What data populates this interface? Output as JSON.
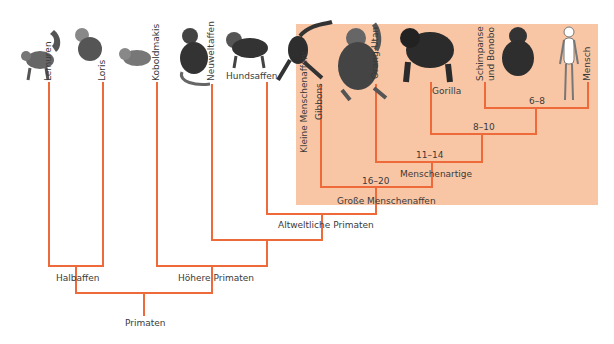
{
  "diagram": {
    "type": "cladogram",
    "colors": {
      "line": "#ef6a3a",
      "highlight": "#f9c6a5",
      "text": "#3a3a3a"
    },
    "taxa": [
      {
        "id": "lemuren",
        "label": "Lemuren",
        "icon": "lemur-icon"
      },
      {
        "id": "loris",
        "label": "Loris",
        "icon": "loris-icon"
      },
      {
        "id": "koboldmakis",
        "label": "Koboldmakis",
        "icon": "tarsier-icon"
      },
      {
        "id": "neuweltaffen",
        "label": "Neuweltaffen",
        "icon": "new-world-monkey-icon"
      },
      {
        "id": "hundsaffen",
        "label": "Hundsaffen",
        "icon": "baboon-icon"
      },
      {
        "id": "gibbons",
        "label": "Gibbons",
        "icon": "gibbon-icon"
      },
      {
        "id": "orang_utan",
        "label": "Orang-Utan",
        "icon": "orangutan-icon"
      },
      {
        "id": "gorilla",
        "label": "Gorilla",
        "icon": "gorilla-icon"
      },
      {
        "id": "schimpanse",
        "label": "Schimpanse und Bonobo",
        "label_line1": "Schimpanse",
        "label_line2": "und Bonobo",
        "icon": "chimpanzee-icon"
      },
      {
        "id": "mensch",
        "label": "Mensch",
        "icon": "human-icon"
      }
    ],
    "group_side_label": "Kleine Menschenaffen:",
    "nodes": [
      {
        "id": "n68",
        "label": "6–8"
      },
      {
        "id": "n810",
        "label": "8–10"
      },
      {
        "id": "n1114",
        "label": "11–14"
      },
      {
        "id": "menschenartige",
        "label": "Menschenartige"
      },
      {
        "id": "n1620",
        "label": "16–20"
      },
      {
        "id": "grosse",
        "label": "Große Menschenaffen"
      },
      {
        "id": "altwelt",
        "label": "Altweltliche Primaten"
      },
      {
        "id": "hoehere",
        "label": "Höhere Primaten"
      },
      {
        "id": "halbaffen",
        "label": "Halbaffen"
      },
      {
        "id": "primaten",
        "label": "Primaten"
      }
    ]
  }
}
